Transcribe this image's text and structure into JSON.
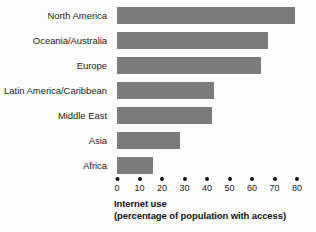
{
  "chart_data": {
    "type": "bar",
    "orientation": "horizontal",
    "title": "",
    "xlabel": "Internet use (percentage of population with access)",
    "ylabel": "",
    "categories": [
      "North America",
      "Oceania/Australia",
      "Europe",
      "Latin America/Caribbean",
      "Middle East",
      "Asia",
      "Africa"
    ],
    "values": [
      79,
      67,
      64,
      43,
      42,
      28,
      16
    ],
    "xlim": [
      0,
      80
    ],
    "ylim": null,
    "xticks": [
      0,
      10,
      20,
      30,
      40,
      50,
      60,
      70,
      80
    ],
    "xtick_labels": [
      "0",
      "10",
      "20",
      "30",
      "40",
      "50",
      "60",
      "70",
      "80"
    ],
    "grid": false,
    "legend": null,
    "legend_position": "none",
    "bar_color": "#7b7b7b",
    "background_color": "#fdfdfd",
    "text_color": "#1b1b1b"
  },
  "axis_title": {
    "line1": "Internet use",
    "line2": "(percentage of population with access)"
  }
}
